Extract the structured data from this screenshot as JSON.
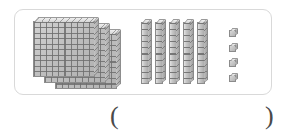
{
  "worksheet": {
    "manipulative": "base-ten-blocks",
    "panel": {
      "border_color": "#d9d9d9",
      "background_color": "#ffffff"
    },
    "groups": [
      {
        "id": "hundreds",
        "place_value_label": "hundreds",
        "unit_value": 100,
        "count": 3,
        "shape": "flat",
        "rows": 10,
        "columns": 10,
        "items": [
          {
            "index": 1,
            "name": "hundred-flat"
          },
          {
            "index": 2,
            "name": "hundred-flat"
          },
          {
            "index": 3,
            "name": "hundred-flat"
          }
        ]
      },
      {
        "id": "tens",
        "place_value_label": "tens",
        "unit_value": 10,
        "count": 5,
        "shape": "rod",
        "segments": 10,
        "items": [
          {
            "index": 1,
            "name": "ten-rod"
          },
          {
            "index": 2,
            "name": "ten-rod"
          },
          {
            "index": 3,
            "name": "ten-rod"
          },
          {
            "index": 4,
            "name": "ten-rod"
          },
          {
            "index": 5,
            "name": "ten-rod"
          }
        ]
      },
      {
        "id": "ones",
        "place_value_label": "ones",
        "unit_value": 1,
        "count": 4,
        "shape": "cube",
        "items": [
          {
            "index": 1,
            "name": "unit-cube"
          },
          {
            "index": 2,
            "name": "unit-cube"
          },
          {
            "index": 3,
            "name": "unit-cube"
          },
          {
            "index": 4,
            "name": "unit-cube"
          }
        ]
      }
    ],
    "block_colors": {
      "face": "#c6c6c6",
      "grid_line": "#6e6e6e",
      "outline": "#8b8b8b",
      "top_face": "#e8e8e8",
      "side_face": "#aaaaaa"
    },
    "answer": {
      "paren_open": "(",
      "paren_close": ")",
      "value": "",
      "placeholder": ""
    }
  }
}
